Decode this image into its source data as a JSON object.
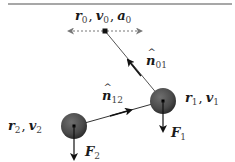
{
  "diagram": {
    "top_boundary": {
      "x1": 8,
      "x2": 232,
      "y": 4,
      "color": "#8a8a8a"
    },
    "particle0": {
      "label": {
        "r": "r",
        "r_sub": "0",
        "v": "v",
        "v_sub": "0",
        "a": "a",
        "a_sub": "0",
        "sep": ","
      },
      "x": 105,
      "y": 31,
      "motion_arrow": {
        "x1": 67,
        "x2": 142,
        "style": "dashed",
        "color": "#777777"
      }
    },
    "particle1": {
      "label": {
        "r": "r",
        "r_sub": "1",
        "v": "v",
        "v_sub": "1",
        "sep": ","
      },
      "x": 163,
      "y": 101,
      "radius": 13,
      "color": "#4a4a4a",
      "force": {
        "label": "F",
        "sub": "1",
        "length": 31
      }
    },
    "particle2": {
      "label": {
        "r": "r",
        "r_sub": "2",
        "v": "v",
        "v_sub": "2",
        "sep": ","
      },
      "x": 74,
      "y": 126,
      "radius": 13,
      "color": "#4a4a4a",
      "force": {
        "label": "F",
        "sub": "2",
        "length": 34
      }
    },
    "normals": [
      {
        "label": "n",
        "hat": "^",
        "sub": "01",
        "from": "particle1",
        "to": "particle0"
      },
      {
        "label": "n",
        "hat": "^",
        "sub": "12",
        "from": "particle2",
        "to": "particle1"
      }
    ]
  }
}
